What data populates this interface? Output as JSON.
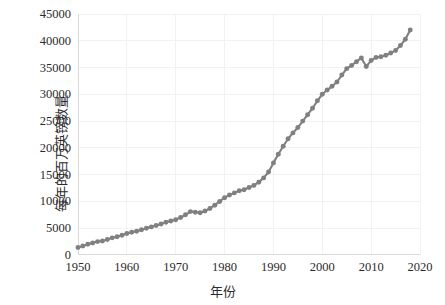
{
  "chart_data": {
    "type": "scatter",
    "title": "",
    "xlabel": "年份",
    "ylabel": "每年的百万英镑数量",
    "xlim": [
      1950,
      2020
    ],
    "ylim": [
      0,
      45000
    ],
    "grid": true,
    "legend": null,
    "series_color": "#808080",
    "xticks": [
      "1950",
      "1960",
      "1970",
      "1980",
      "1990",
      "2000",
      "2010",
      "2020"
    ],
    "xtick_values": [
      1950,
      1960,
      1970,
      1980,
      1990,
      2000,
      2010,
      2020
    ],
    "yticks": [
      "0",
      "5000",
      "10000",
      "15000",
      "20000",
      "25000",
      "30000",
      "35000",
      "40000",
      "45000"
    ],
    "ytick_values": [
      0,
      5000,
      10000,
      15000,
      20000,
      25000,
      30000,
      35000,
      40000,
      45000
    ],
    "x": [
      1950,
      1951,
      1952,
      1953,
      1954,
      1955,
      1956,
      1957,
      1958,
      1959,
      1960,
      1961,
      1962,
      1963,
      1964,
      1965,
      1966,
      1967,
      1968,
      1969,
      1970,
      1971,
      1972,
      1973,
      1974,
      1975,
      1976,
      1977,
      1978,
      1979,
      1980,
      1981,
      1982,
      1983,
      1984,
      1985,
      1986,
      1987,
      1988,
      1989,
      1990,
      1991,
      1992,
      1993,
      1994,
      1995,
      1996,
      1997,
      1998,
      1999,
      2000,
      2001,
      2002,
      2003,
      2004,
      2005,
      2006,
      2007,
      2008,
      2009,
      2010,
      2011,
      2012,
      2013,
      2014,
      2015,
      2016,
      2017,
      2018
    ],
    "values": [
      1400,
      1700,
      2000,
      2250,
      2500,
      2600,
      2900,
      3200,
      3400,
      3700,
      4000,
      4250,
      4450,
      4700,
      5000,
      5250,
      5500,
      5800,
      6100,
      6350,
      6600,
      7000,
      7500,
      8100,
      8000,
      7900,
      8200,
      8700,
      9300,
      10000,
      10700,
      11200,
      11600,
      12000,
      12200,
      12600,
      13000,
      13600,
      14400,
      15500,
      17200,
      18800,
      20300,
      21700,
      22800,
      23800,
      25000,
      26200,
      27400,
      28800,
      30000,
      30800,
      31500,
      32300,
      33600,
      34800,
      35400,
      36100,
      36800,
      35200,
      36300,
      36900,
      37000,
      37300,
      37700,
      38200,
      39100,
      40300,
      42000
    ],
    "marker": "circle",
    "marker_size": 4
  },
  "axis_titles": {
    "y": "每年的百万英镑数量",
    "x": "年份"
  }
}
